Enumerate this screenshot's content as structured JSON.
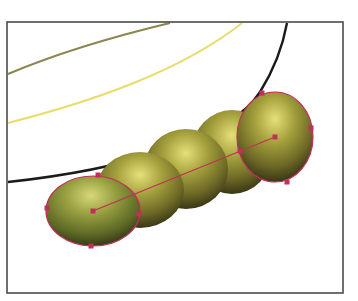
{
  "illustration": {
    "description": "Blend of five shaded olive-green spheres along a straight spine with selected anchor points",
    "colors": {
      "frame": "#4a4a4a",
      "curve_olive": "#8a8650",
      "curve_yellow": "#e8dc6a",
      "curve_black": "#1a1a1a",
      "sphere_highlight": "#e6e07a",
      "sphere_mid": "#8a8a30",
      "sphere_shadow": "#3a3516",
      "selection": "#c0305a"
    },
    "frame": {
      "x": 7,
      "y": 22,
      "width": 336,
      "height": 271
    },
    "spheres": [
      {
        "cx": 93,
        "cy": 211,
        "rx": 47,
        "ry": 35
      },
      {
        "cx": 140,
        "cy": 190,
        "rx": 44,
        "ry": 38
      },
      {
        "cx": 186,
        "cy": 169,
        "rx": 42,
        "ry": 40
      },
      {
        "cx": 232,
        "cy": 152,
        "rx": 40,
        "ry": 42
      },
      {
        "cx": 275,
        "cy": 137,
        "rx": 38,
        "ry": 45
      }
    ],
    "spine": {
      "x1": 93,
      "y1": 211,
      "x2": 275,
      "y2": 137
    },
    "anchors_front": [
      [
        47,
        208
      ],
      [
        98,
        175
      ],
      [
        139,
        214
      ],
      [
        91,
        246
      ],
      [
        93,
        211
      ]
    ],
    "anchors_back": [
      [
        262,
        93
      ],
      [
        311,
        128
      ],
      [
        287,
        182
      ],
      [
        240,
        151
      ],
      [
        275,
        137
      ]
    ]
  }
}
